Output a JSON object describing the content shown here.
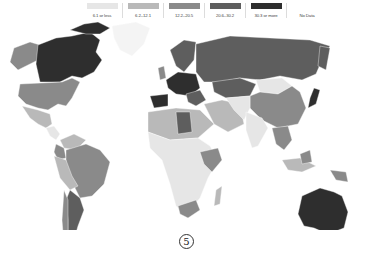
{
  "legend": {
    "items": [
      {
        "label": "6.1 or less",
        "color": "#e6e6e6"
      },
      {
        "label": "6.2–12.1",
        "color": "#b9b9b9"
      },
      {
        "label": "12.2–20.5",
        "color": "#8a8a8a"
      },
      {
        "label": "20.6–30.2",
        "color": "#5e5e5e"
      },
      {
        "label": "30.3 or more",
        "color": "#2e2e2e"
      },
      {
        "label": "No Data",
        "color": "#ffffff"
      }
    ]
  },
  "map": {
    "type": "choropleth world map",
    "regions": [
      {
        "name": "Canada",
        "class": "30.3 or more"
      },
      {
        "name": "Alaska",
        "class": "12.2–20.5"
      },
      {
        "name": "United States",
        "class": "12.2–20.5"
      },
      {
        "name": "Greenland",
        "class": "No Data"
      },
      {
        "name": "Mexico",
        "class": "6.2–12.1"
      },
      {
        "name": "Central America",
        "class": "6.1 or less"
      },
      {
        "name": "Colombia",
        "class": "12.2–20.5"
      },
      {
        "name": "Venezuela",
        "class": "6.2–12.1"
      },
      {
        "name": "Brazil",
        "class": "12.2–20.5"
      },
      {
        "name": "Peru",
        "class": "6.2–12.1"
      },
      {
        "name": "Bolivia",
        "class": "6.2–12.1"
      },
      {
        "name": "Argentina",
        "class": "20.6–30.2"
      },
      {
        "name": "Chile",
        "class": "12.2–20.5"
      },
      {
        "name": "Western Europe",
        "class": "30.3 or more"
      },
      {
        "name": "Spain",
        "class": "30.3 or more"
      },
      {
        "name": "Scandinavia",
        "class": "20.6–30.2"
      },
      {
        "name": "Russia",
        "class": "20.6–30.2"
      },
      {
        "name": "Kazakhstan",
        "class": "20.6–30.2"
      },
      {
        "name": "Mongolia",
        "class": "6.1 or less"
      },
      {
        "name": "China",
        "class": "12.2–20.5"
      },
      {
        "name": "Japan",
        "class": "30.3 or more"
      },
      {
        "name": "India",
        "class": "6.1 or less"
      },
      {
        "name": "Middle East",
        "class": "6.2–12.1"
      },
      {
        "name": "Libya",
        "class": "20.6–30.2"
      },
      {
        "name": "North Africa",
        "class": "6.2–12.1"
      },
      {
        "name": "Sub-Saharan Africa",
        "class": "6.1 or less"
      },
      {
        "name": "East Africa",
        "class": "12.2–20.5"
      },
      {
        "name": "South Africa",
        "class": "12.2–20.5"
      },
      {
        "name": "Madagascar",
        "class": "6.2–12.1"
      },
      {
        "name": "Southeast Asia",
        "class": "12.2–20.5"
      },
      {
        "name": "Indonesia",
        "class": "6.2–12.1"
      },
      {
        "name": "Papua New Guinea",
        "class": "12.2–20.5"
      },
      {
        "name": "Australia",
        "class": "30.3 or more"
      },
      {
        "name": "New Zealand",
        "class": "30.3 or more"
      }
    ]
  },
  "page_number": "5"
}
